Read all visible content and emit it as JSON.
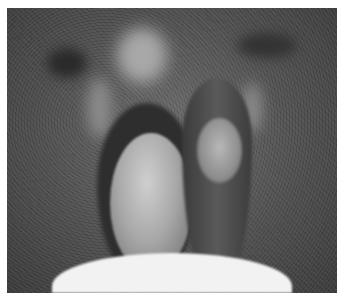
{
  "image": {
    "type": "grayscale-clinical-photograph",
    "has_text": false,
    "frame": {
      "x": 7,
      "y": 8,
      "width": 330,
      "height": 285
    },
    "colors": {
      "page_background": "#ffffff",
      "photo_background": "#505050",
      "dark_regions": "#2e2e2e",
      "highlight_regions": "#cfcfcf",
      "bottom_drape": "#f2f2f2"
    }
  }
}
